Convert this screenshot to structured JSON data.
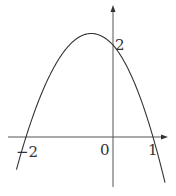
{
  "chart_data": {
    "type": "line",
    "title": "",
    "function": "y = -x^2 - x + 2",
    "series": [
      {
        "name": "parabola",
        "x": [
          -2.25,
          -2,
          -1.5,
          -1,
          -0.5,
          0,
          0.5,
          1,
          1.3
        ],
        "values": [
          -0.8125,
          0,
          1.25,
          2,
          2.25,
          2,
          1.25,
          0,
          -0.99
        ]
      }
    ],
    "key_points": {
      "x_intercepts": [
        -2,
        1
      ],
      "y_intercept": 2,
      "vertex": [
        -0.5,
        2.25
      ]
    },
    "xlabel": "",
    "ylabel": "",
    "grid": false,
    "legend": "none"
  },
  "labels": {
    "y_intercept": "2",
    "origin": "0",
    "x_left": "−2",
    "x_right": "1"
  },
  "colors": {
    "curve": "#333333",
    "axis": "#555555"
  }
}
